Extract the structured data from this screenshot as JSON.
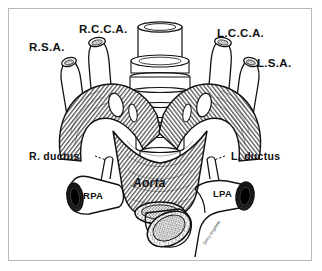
{
  "figure": {
    "kind": "anatomical-engraving",
    "border_color": "#b9b9b9",
    "background_color": "#ffffff",
    "ink_color": "#111111",
    "style": "black-and-white line engraving with cross-hatching and stipple"
  },
  "labels": {
    "rsa": "R.S.A.",
    "rcca": "R.C.C.A.",
    "lcca": "L.C.C.A.",
    "lsa": "L.S.A.",
    "r_ductus": "R. ductus",
    "l_ductus": "L. ductus",
    "aorta": "Aorta",
    "rpa": "RPA",
    "lpa": "LPA",
    "signature": "Gerry Angeletti"
  },
  "structures": [
    {
      "name": "trachea",
      "label": null,
      "note": "central ribbed tube with cartilage rings"
    },
    {
      "name": "right-subclavian-artery",
      "label": "R.S.A."
    },
    {
      "name": "right-common-carotid-artery",
      "label": "R.C.C.A."
    },
    {
      "name": "left-common-carotid-artery",
      "label": "L.C.C.A."
    },
    {
      "name": "left-subclavian-artery",
      "label": "L.S.A."
    },
    {
      "name": "right-ductus-arteriosus",
      "label": "R. ductus"
    },
    {
      "name": "left-ductus-arteriosus",
      "label": "L. ductus"
    },
    {
      "name": "descending-aorta",
      "label": "Aorta"
    },
    {
      "name": "right-pulmonary-artery",
      "label": "RPA"
    },
    {
      "name": "left-pulmonary-artery",
      "label": "LPA"
    },
    {
      "name": "pulmonary-trunk",
      "label": null
    }
  ]
}
